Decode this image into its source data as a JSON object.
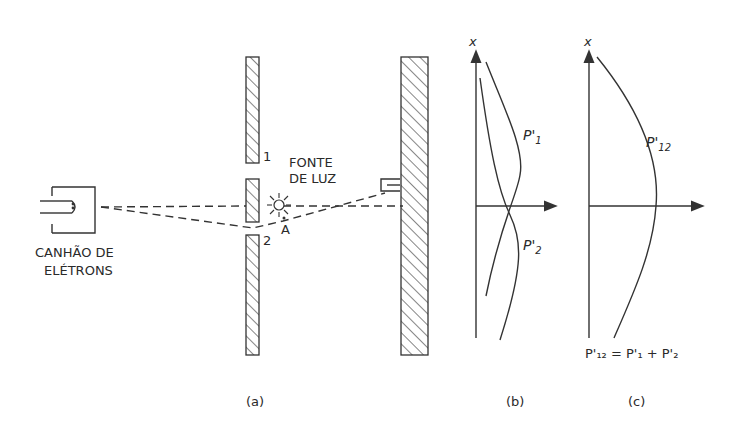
{
  "panels": {
    "a": {
      "caption": "(a)",
      "gun_label_line1": "CANHÃO DE",
      "gun_label_line2": "ELÉTRONS",
      "slit1_label": "1",
      "slit2_label": "2",
      "light_label_line1": "FONTE",
      "light_label_line2": "DE LUZ",
      "point_label": "A"
    },
    "b": {
      "caption": "(b)",
      "axis_label": "x",
      "curve1_label": "P'",
      "curve1_sub": "1",
      "curve2_label": "P'",
      "curve2_sub": "2"
    },
    "c": {
      "caption": "(c)",
      "axis_label": "x",
      "curve_label": "P'",
      "curve_sub": "12",
      "equation": "P'₁₂ = P'₁ + P'₂"
    }
  },
  "icons": {
    "electron_gun": "electron-gun-icon",
    "light_source": "sun-burst-icon",
    "detector": "detector-icon"
  }
}
